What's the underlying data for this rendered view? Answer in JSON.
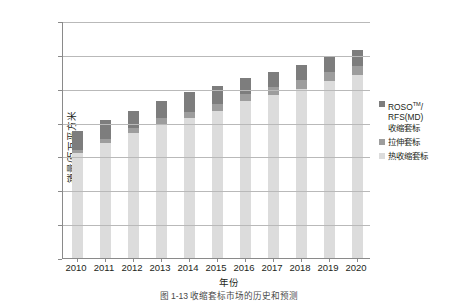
{
  "chart_data": {
    "type": "bar",
    "stacked": true,
    "title": "",
    "xlabel": "年份",
    "ylabel": "销量/百万平方米",
    "categories": [
      "2010",
      "2011",
      "2012",
      "2013",
      "2014",
      "2015",
      "2016",
      "2017",
      "2018",
      "2019",
      "2020"
    ],
    "series": [
      {
        "name": "热收缩套标",
        "color": "#dcdcdc",
        "values": [
          6200,
          6800,
          7400,
          7900,
          8250,
          8700,
          9250,
          9650,
          10000,
          10450,
          10800
        ]
      },
      {
        "name": "拉伸套标",
        "color": "#9d9d9d",
        "values": [
          200,
          250,
          300,
          350,
          400,
          420,
          450,
          470,
          490,
          510,
          530
        ]
      },
      {
        "name": "ROSO™/RFS(MD)收缩套标",
        "color": "#7d7d7d",
        "values": [
          1100,
          1100,
          1000,
          1050,
          1150,
          1030,
          950,
          880,
          910,
          940,
          970
        ]
      }
    ],
    "totals": [
      7500,
      8150,
      8700,
      9300,
      9800,
      10150,
      10650,
      11000,
      11400,
      11900,
      12300
    ],
    "ylim": [
      0,
      14000
    ],
    "yticks": [
      0,
      2000,
      4000,
      6000,
      8000,
      10000,
      12000,
      14000
    ],
    "ytick_labels": [
      "0",
      "2000",
      "4000",
      "6000",
      "8000",
      "10000",
      "12000",
      "14000"
    ],
    "grid": true,
    "legend_position": "right"
  },
  "legend": {
    "items": [
      {
        "label_line1": "ROSO",
        "label_sup": "TM",
        "label_line1_tail": "/",
        "label_line2": "RFS(MD)",
        "label_line3": "收缩套标",
        "color": "#7d7d7d"
      },
      {
        "label": "拉伸套标",
        "color": "#9d9d9d"
      },
      {
        "label": "热收缩套标",
        "color": "#dcdcdc"
      }
    ]
  },
  "axis": {
    "x_title": "年份",
    "y_title": "销量/百万平方米"
  },
  "caption": "图 1-13  收缩套标市场的历史和预测"
}
